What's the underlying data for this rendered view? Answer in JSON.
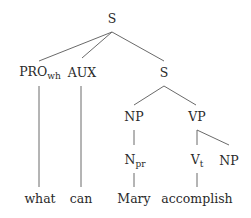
{
  "diagram": {
    "type": "syntax-tree",
    "nodes": [
      {
        "id": "S_root",
        "label": "S",
        "sub": "",
        "x": 112,
        "y": 19
      },
      {
        "id": "PRO_wh",
        "label": "PRO",
        "sub": "wh",
        "x": 40,
        "y": 73
      },
      {
        "id": "AUX",
        "label": "AUX",
        "sub": "",
        "x": 82,
        "y": 73
      },
      {
        "id": "S_inner",
        "label": "S",
        "sub": "",
        "x": 164,
        "y": 73
      },
      {
        "id": "NP_subj",
        "label": "NP",
        "sub": "",
        "x": 134,
        "y": 117
      },
      {
        "id": "VP",
        "label": "VP",
        "sub": "",
        "x": 197,
        "y": 117
      },
      {
        "id": "N_pr",
        "label": "N",
        "sub": "pr",
        "x": 135,
        "y": 161
      },
      {
        "id": "V_t",
        "label": "V",
        "sub": "t",
        "x": 197,
        "y": 161
      },
      {
        "id": "NP_obj",
        "label": "NP",
        "sub": "",
        "x": 229,
        "y": 161
      },
      {
        "id": "w_what",
        "label": "what",
        "sub": "",
        "x": 40,
        "y": 199
      },
      {
        "id": "w_can",
        "label": "can",
        "sub": "",
        "x": 81,
        "y": 199
      },
      {
        "id": "w_mary",
        "label": "Mary",
        "sub": "",
        "x": 134,
        "y": 199
      },
      {
        "id": "w_accomplish",
        "label": "accomplish",
        "sub": "",
        "x": 197,
        "y": 199
      }
    ],
    "edges": [
      {
        "from": "S_root",
        "to": "PRO_wh",
        "x1": 112,
        "y1": 32,
        "x2": 39,
        "y2": 61
      },
      {
        "from": "S_root",
        "to": "AUX",
        "x1": 112,
        "y1": 32,
        "x2": 82,
        "y2": 58
      },
      {
        "from": "S_root",
        "to": "S_inner",
        "x1": 112,
        "y1": 32,
        "x2": 164,
        "y2": 61
      },
      {
        "from": "PRO_wh",
        "to": "w_what",
        "x1": 39,
        "y1": 86,
        "x2": 39,
        "y2": 187
      },
      {
        "from": "AUX",
        "to": "w_can",
        "x1": 81,
        "y1": 86,
        "x2": 81,
        "y2": 187
      },
      {
        "from": "S_inner",
        "to": "NP_subj",
        "x1": 164,
        "y1": 86,
        "x2": 134,
        "y2": 105
      },
      {
        "from": "S_inner",
        "to": "VP",
        "x1": 164,
        "y1": 86,
        "x2": 196,
        "y2": 105
      },
      {
        "from": "NP_subj",
        "to": "N_pr",
        "x1": 134,
        "y1": 130,
        "x2": 134,
        "y2": 145
      },
      {
        "from": "VP",
        "to": "V_t",
        "x1": 197,
        "y1": 130,
        "x2": 197,
        "y2": 145
      },
      {
        "from": "VP",
        "to": "NP_obj",
        "x1": 197,
        "y1": 130,
        "x2": 229,
        "y2": 145
      },
      {
        "from": "N_pr",
        "to": "w_mary",
        "x1": 134,
        "y1": 173,
        "x2": 134,
        "y2": 187
      },
      {
        "from": "V_t",
        "to": "w_accomplish",
        "x1": 197,
        "y1": 173,
        "x2": 197,
        "y2": 187
      }
    ]
  },
  "labels": {
    "s_root": "S",
    "pro": "PRO",
    "pro_sub": "wh",
    "aux": "AUX",
    "s_inner": "S",
    "np_subj": "NP",
    "vp": "VP",
    "n": "N",
    "n_sub": "pr",
    "v": "V",
    "v_sub": "t",
    "np_obj": "NP",
    "word_what": "what",
    "word_can": "can",
    "word_mary": "Mary",
    "word_accomplish": "accomplish"
  }
}
